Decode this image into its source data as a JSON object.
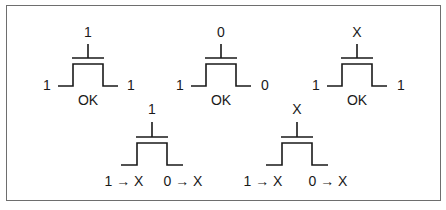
{
  "diagram": {
    "type": "nmos-transistor-switch-cases",
    "transistors": [
      {
        "id": "t1",
        "gate": "1",
        "left": "1",
        "right": "1",
        "result": "OK"
      },
      {
        "id": "t2",
        "gate": "0",
        "left": "1",
        "right": "0",
        "result": "OK"
      },
      {
        "id": "t3",
        "gate": "X",
        "left": "1",
        "right": "1",
        "result": "OK"
      },
      {
        "id": "t4",
        "gate": "1",
        "left": "1 → X",
        "right": "0 → X",
        "result": ""
      },
      {
        "id": "t5",
        "gate": "X",
        "left": "1 → X",
        "right": "0 → X",
        "result": ""
      }
    ],
    "colors": {
      "stroke": "#1a1a1a",
      "frame": "#6e6e6e",
      "background": "#ffffff"
    }
  }
}
